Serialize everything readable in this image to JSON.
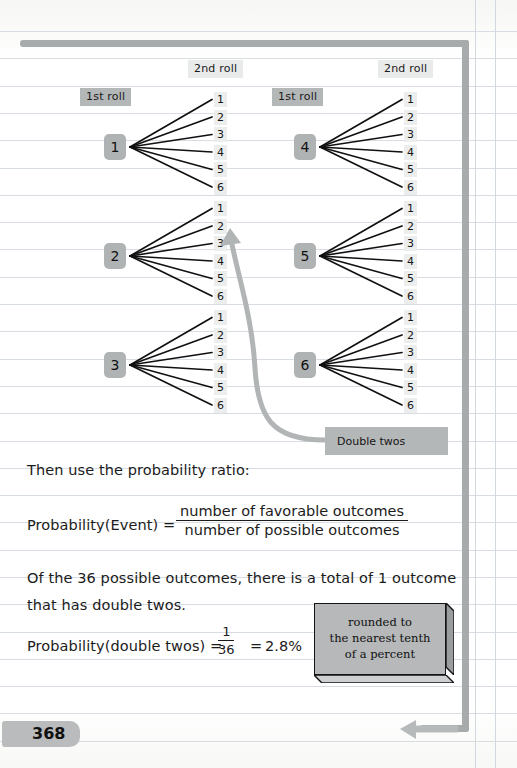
{
  "page": {
    "number": "368"
  },
  "headers": {
    "first_roll_label": "1st roll",
    "second_roll_label": "2nd roll"
  },
  "trees": [
    {
      "root": "1",
      "leaves": [
        "1",
        "2",
        "3",
        "4",
        "5",
        "6"
      ]
    },
    {
      "root": "2",
      "leaves": [
        "1",
        "2",
        "3",
        "4",
        "5",
        "6"
      ]
    },
    {
      "root": "3",
      "leaves": [
        "1",
        "2",
        "3",
        "4",
        "5",
        "6"
      ]
    },
    {
      "root": "4",
      "leaves": [
        "1",
        "2",
        "3",
        "4",
        "5",
        "6"
      ]
    },
    {
      "root": "5",
      "leaves": [
        "1",
        "2",
        "3",
        "4",
        "5",
        "6"
      ]
    },
    {
      "root": "6",
      "leaves": [
        "1",
        "2",
        "3",
        "4",
        "5",
        "6"
      ]
    }
  ],
  "annotations": {
    "double_twos": "Double twos",
    "rounding_note": "rounded to\nthe nearest tenth\nof a percent"
  },
  "body": {
    "intro": "Then use the probability ratio:",
    "formula1_left": "Probability(Event) =",
    "formula1_numerator": "number of favorable outcomes",
    "formula1_denominator": "number of possible outcomes",
    "paragraph_line1": "Of the 36 possible outcomes, there is a total of 1 outcome",
    "paragraph_line2": "that has double twos.",
    "formula2_left": "Probability(double twos) =",
    "formula2_numerator": "1",
    "formula2_denominator": "36",
    "formula2_equals": "=",
    "formula2_result": "2.8%"
  },
  "colors": {
    "border_gray": "#a8abac",
    "chip_dark": "#b4b7b8",
    "chip_light": "#e9eaea",
    "rule_line": "#d7dde2",
    "ink": "#1b1b1b",
    "callout_fill": "#b6b8b9"
  }
}
